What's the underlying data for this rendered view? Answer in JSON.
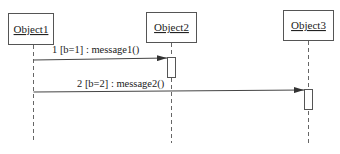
{
  "diagram": {
    "type": "sequence",
    "objects": [
      {
        "id": "object1",
        "label": "Object1"
      },
      {
        "id": "object2",
        "label": "Object2"
      },
      {
        "id": "object3",
        "label": "Object3"
      }
    ],
    "messages": [
      {
        "seq": "1",
        "guard": "[b=1]",
        "name": "message1()",
        "from": "Object1",
        "to": "Object2",
        "label": "1 [b=1] : message1()"
      },
      {
        "seq": "2",
        "guard": "[b=2]",
        "name": "message2()",
        "from": "Object1",
        "to": "Object3",
        "label": "2 [b=2] : message2()"
      }
    ],
    "colors": {
      "stroke": "#444444",
      "background": "#ffffff"
    }
  }
}
